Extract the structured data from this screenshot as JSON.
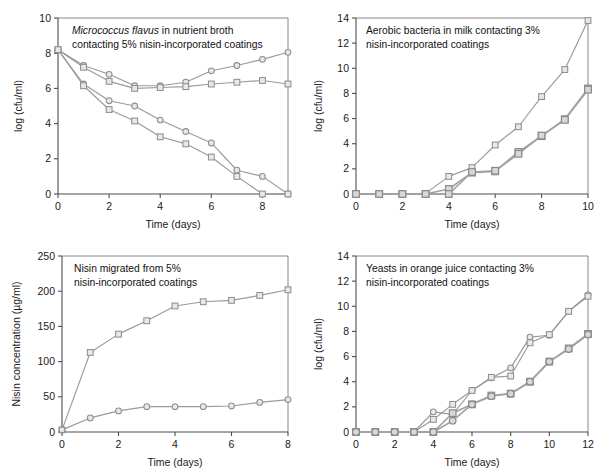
{
  "figure": {
    "background_color": "#ffffff",
    "line_color": "#9a9a9a",
    "marker_fill": "#e8e8e8",
    "marker_stroke": "#8f8f8f",
    "axis_color": "#4d4d4d",
    "text_color": "#1a1a1a"
  },
  "chart_data": [
    {
      "id": "panel-top-left",
      "type": "line",
      "title": "Micrococcus flavus in nutrient broth contacting 5% nisin-incorporated coatings",
      "caption_line1_italic": "Micrococcus flavus",
      "caption_line1_rest": " in nutrient broth",
      "caption_line2": "contacting 5% nisin-incorporated coatings",
      "xlabel": "Time (days)",
      "ylabel": "log (cfu/ml)",
      "xlim": [
        0,
        9
      ],
      "ylim": [
        0,
        10
      ],
      "xticks": [
        0,
        2,
        4,
        6,
        8
      ],
      "yticks": [
        0,
        2,
        4,
        6,
        8,
        10
      ],
      "xtick_labels": [
        "0",
        "2",
        "4",
        "6",
        "8"
      ],
      "ytick_labels": [
        "0",
        "2",
        "4",
        "6",
        "8",
        "10"
      ],
      "grid": false,
      "legend": "none",
      "x": [
        0,
        1,
        2,
        3,
        4,
        5,
        6,
        7,
        8,
        9
      ],
      "series": [
        {
          "name": "control-circle",
          "marker": "circle",
          "values": [
            8.2,
            7.3,
            6.8,
            6.15,
            6.15,
            6.35,
            7.0,
            7.3,
            7.65,
            8.05
          ]
        },
        {
          "name": "control-square",
          "marker": "square",
          "values": [
            8.2,
            7.2,
            6.4,
            6.0,
            6.05,
            6.1,
            6.25,
            6.35,
            6.45,
            6.25
          ]
        },
        {
          "name": "nisin-circle",
          "marker": "circle",
          "values": [
            8.2,
            6.25,
            5.3,
            5.0,
            4.2,
            3.55,
            2.9,
            1.35,
            1.0,
            0.0
          ]
        },
        {
          "name": "nisin-square",
          "marker": "square",
          "values": [
            8.2,
            6.15,
            4.8,
            4.15,
            3.25,
            2.85,
            2.1,
            1.0,
            0.0,
            0.0
          ]
        }
      ]
    },
    {
      "id": "panel-top-right",
      "type": "line",
      "title": "Aerobic bacteria in milk contacting 3% nisin-incorporated coatings",
      "caption_line1": "Aerobic bacteria in milk contacting 3%",
      "caption_line2": "nisin-incorporated coatings",
      "xlabel": "Time (days)",
      "ylabel": "log (cfu/ml)",
      "xlim": [
        0,
        10
      ],
      "ylim": [
        0,
        14
      ],
      "xticks": [
        0,
        2,
        4,
        6,
        8,
        10
      ],
      "yticks": [
        0,
        2,
        4,
        6,
        8,
        10,
        12,
        14
      ],
      "xtick_labels": [
        "0",
        "2",
        "4",
        "6",
        "8",
        "10"
      ],
      "ytick_labels": [
        "0",
        "2",
        "4",
        "6",
        "8",
        "10",
        "12",
        "14"
      ],
      "grid": false,
      "legend": "none",
      "x": [
        0,
        1,
        2,
        3,
        4,
        5,
        6,
        7,
        8,
        9,
        10
      ],
      "series": [
        {
          "name": "control-square",
          "marker": "square",
          "values": [
            0.0,
            0.0,
            0.0,
            0.05,
            1.4,
            2.1,
            3.9,
            5.35,
            7.75,
            9.9,
            13.8
          ]
        },
        {
          "name": "nisin-square-a",
          "marker": "square",
          "values": [
            0.0,
            0.0,
            0.0,
            0.0,
            0.4,
            1.7,
            1.8,
            3.35,
            4.6,
            5.95,
            8.4
          ]
        },
        {
          "name": "nisin-square-b",
          "marker": "square",
          "values": [
            0.0,
            0.0,
            0.0,
            0.0,
            0.0,
            1.75,
            1.85,
            3.2,
            4.65,
            5.9,
            8.3
          ]
        }
      ]
    },
    {
      "id": "panel-bottom-left",
      "type": "line",
      "title": "Nisin migrated from 5% nisin-incorporated coatings",
      "caption_line1": "Nisin migrated from 5%",
      "caption_line2": "nisin-incorporated coatings",
      "xlabel": "Time (days)",
      "ylabel": "Nisin concentration (µg/ml)",
      "xlim": [
        0,
        8
      ],
      "ylim": [
        0,
        250
      ],
      "xticks": [
        0,
        2,
        4,
        6,
        8
      ],
      "yticks": [
        0,
        50,
        100,
        150,
        200,
        250
      ],
      "xtick_labels": [
        "0",
        "2",
        "4",
        "6",
        "8"
      ],
      "ytick_labels": [
        "0",
        "50",
        "100",
        "150",
        "200",
        "250"
      ],
      "grid": false,
      "legend": "none",
      "x": [
        0,
        1,
        2,
        3,
        4,
        5,
        6,
        7,
        8
      ],
      "series": [
        {
          "name": "high-dose-square",
          "marker": "square",
          "values": [
            3,
            113,
            139,
            158,
            179,
            185,
            187,
            194,
            202
          ]
        },
        {
          "name": "low-dose-circle",
          "marker": "circle",
          "values": [
            3,
            20,
            30,
            36,
            36,
            36,
            37,
            42,
            46
          ]
        }
      ]
    },
    {
      "id": "panel-bottom-right",
      "type": "line",
      "title": "Yeasts in orange juice contacting 3% nisin-incorporated coatings",
      "caption_line1": "Yeasts in orange juice contacting 3%",
      "caption_line2": "nisin-incorporated coatings",
      "xlabel": "Time (days)",
      "ylabel": "log (cfu/ml)",
      "xlim": [
        0,
        12
      ],
      "ylim": [
        0,
        14
      ],
      "xticks": [
        0,
        2,
        4,
        6,
        8,
        10,
        12
      ],
      "yticks": [
        0,
        2,
        4,
        6,
        8,
        10,
        12,
        14
      ],
      "xtick_labels": [
        "0",
        "2",
        "4",
        "6",
        "8",
        "10",
        "12"
      ],
      "ytick_labels": [
        "0",
        "2",
        "4",
        "6",
        "8",
        "10",
        "12",
        "14"
      ],
      "grid": false,
      "legend": "none",
      "x": [
        0,
        1,
        2,
        3,
        4,
        5,
        6,
        7,
        8,
        9,
        10,
        11,
        12
      ],
      "series": [
        {
          "name": "control-circle",
          "marker": "circle",
          "values": [
            0.0,
            0.0,
            0.0,
            0.0,
            1.6,
            1.4,
            3.3,
            4.3,
            5.1,
            7.55,
            7.7,
            9.6,
            10.9
          ]
        },
        {
          "name": "control-square",
          "marker": "square",
          "values": [
            0.0,
            0.0,
            0.0,
            0.0,
            1.0,
            2.2,
            3.3,
            4.35,
            4.45,
            7.1,
            7.75,
            9.6,
            10.8
          ]
        },
        {
          "name": "nisin-square",
          "marker": "square",
          "values": [
            0.0,
            0.0,
            0.0,
            0.0,
            0.0,
            1.5,
            2.2,
            2.9,
            3.05,
            4.0,
            5.6,
            6.65,
            7.8
          ]
        },
        {
          "name": "nisin-circle",
          "marker": "circle",
          "values": [
            0.0,
            0.0,
            0.0,
            0.0,
            0.0,
            0.9,
            2.2,
            2.85,
            3.05,
            4.0,
            5.6,
            6.6,
            7.75
          ]
        }
      ]
    }
  ]
}
